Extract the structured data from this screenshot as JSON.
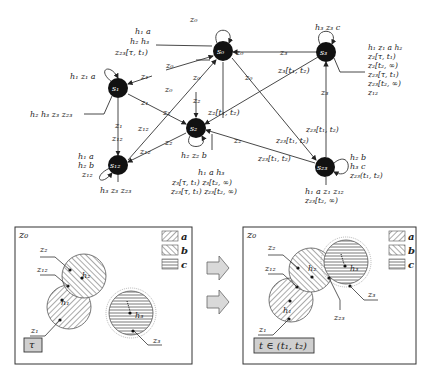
{
  "graph": {
    "nodes": [
      {
        "id": "s0",
        "label": "s₀",
        "x": 223,
        "y": 51
      },
      {
        "id": "s1",
        "label": "s₁",
        "x": 118,
        "y": 88
      },
      {
        "id": "s2",
        "label": "s₂",
        "x": 196,
        "y": 128
      },
      {
        "id": "s3",
        "label": "s₃",
        "x": 326,
        "y": 52
      },
      {
        "id": "s12",
        "label": "s₁₂",
        "x": 118,
        "y": 165
      },
      {
        "id": "s23",
        "label": "s₂₃",
        "x": 325,
        "y": 167
      }
    ],
    "node_annotations": {
      "s0_loop": "z₀",
      "s0_left": [
        "h₁ a",
        "h₂ h₃",
        "z₂₃[τ, t₁)"
      ],
      "s1_loop": "h₁ z₁ a",
      "s1_left": "h₂ h₃ z₃ z₂₃",
      "s3_loop": "h₃ z₃ c",
      "s3_right": [
        "h₁ z₁ a h₂",
        "z₂[τ, t₁)",
        "z₂[t₂, ∞)",
        "z₂₃[τ, t₁)",
        "z₂₃[t₂, ∞)",
        "z₁₂"
      ],
      "s12_left": [
        "h₁ a",
        "h₂ b",
        "z₁₂"
      ],
      "s12_bottom": "h₃ z₃ z₂₃",
      "s2_loop": "h₂ z₂ b",
      "s2_bottom": [
        "h₁ a h₃",
        "z₃[τ, t₁)  z₃[t₂, ∞)",
        "z₂₃[τ, t₁)  z₂₃[t₂, ∞)"
      ],
      "s23_right": [
        "h₂ b",
        "h₃ c",
        "z₂₃(t₁, t₂)"
      ],
      "s23_bottom": [
        "h₁ a z₁ z₁₂",
        "z₂₃[t₂, ∞)"
      ]
    },
    "edge_labels": {
      "s0_s3_left": "z₀",
      "s0_s3_right": "z₃",
      "s1_s0_a": "z₀",
      "s1_s0_b": "z₁",
      "s12_s0": "z₀",
      "s0_s2_a": "z₀",
      "s0_s2_b": "z₂",
      "s0_s23": "z₀",
      "s1_s12_a": "z₁",
      "s1_s12_b": "z₁₂",
      "s1_s2_a": "z₁",
      "s1_s2_b": "z₂",
      "s12_diag": "z₁₂",
      "s2_s12_a": "z₂",
      "s2_s12_b": "z₁₂",
      "s3_s2": "z₃[t₁, t₂)",
      "s2_in": "z₂[t₁, t₂)",
      "s3_s23_a": "z₃",
      "s3_s23_b": "z₂₃[t₁, t₂)",
      "s23_s2_a": "z₂",
      "s23_s2_b": "z₂₃[t₁, t₂)",
      "s23_in_a": "z₂₃[t₁, t₂)",
      "s23_in_b": "z₂₃[t₁, t₂)"
    }
  },
  "panels": [
    {
      "corner_label": "z₀",
      "time_label": "τ",
      "labels": {
        "z2": "z₂",
        "z12": "z₁₂",
        "z1": "z₁",
        "z3": "z₃",
        "h1": "h₁",
        "h2": "h₂",
        "h3": "h₃"
      }
    },
    {
      "corner_label": "z₀",
      "time_label": "t ∈ (t₁, t₂)",
      "labels": {
        "z2": "z₂",
        "z12": "z₁₂",
        "z1": "z₁",
        "z3": "z₃",
        "z23": "z₂₃",
        "h1": "h₁",
        "h2": "h₂",
        "h3": "h₃"
      }
    }
  ],
  "legend": [
    {
      "key": "a",
      "pattern": "diagonal-forward"
    },
    {
      "key": "b",
      "pattern": "diagonal-backward"
    },
    {
      "key": "c",
      "pattern": "horizontal"
    }
  ],
  "arrows": [
    "right-arrow",
    "right-arrow"
  ],
  "colors": {
    "node": "#111111",
    "line": "#333333",
    "arrow_fill": "#d9d9d9",
    "time_box": "#cfcfcf"
  }
}
